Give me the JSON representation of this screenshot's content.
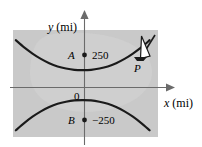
{
  "figure": {
    "background_color": "#ffffff",
    "plot_area_color": "#c9c9c9",
    "plot_area_color_light": "#d4d4d4",
    "curve_color": "#1a1a1a",
    "axis_color": "#6b6b6b",
    "text_color": "#000000"
  },
  "axes": {
    "y_axis_label": "y",
    "y_axis_unit": "(mi)",
    "x_axis_label": "x",
    "x_axis_unit": "(mi)",
    "origin_label": "0"
  },
  "points": [
    {
      "id": "A",
      "name": "A",
      "value_label": "250",
      "marker": "filled-dot",
      "x": 251,
      "y": 250
    },
    {
      "id": "B",
      "name": "B",
      "value_label": "−250",
      "marker": "filled-dot",
      "x": 251,
      "y": -250
    },
    {
      "id": "P",
      "name": "P",
      "value_label": "",
      "marker": "ship",
      "x": 400,
      "y": 150
    }
  ],
  "icons": {
    "ship": "sailboat-icon",
    "dot": "point-marker-icon",
    "x_arrow": "arrow-right-icon",
    "y_arrow": "arrow-up-icon"
  },
  "chart_data": {
    "type": "line",
    "title": "",
    "xlabel": "x (mi)",
    "ylabel": "y (mi)",
    "grid": false,
    "legend": null,
    "xlim": [
      -260,
      260
    ],
    "ylim": [
      -200,
      200
    ],
    "annotations": [
      {
        "text": "A",
        "x": -18,
        "y": 92,
        "style": "italic"
      },
      {
        "text": "250",
        "x": 15,
        "y": 92,
        "style": "normal"
      },
      {
        "text": "B",
        "x": -18,
        "y": -92,
        "style": "italic"
      },
      {
        "text": "−250",
        "x": 15,
        "y": -92,
        "style": "normal"
      },
      {
        "text": "P",
        "x": 118,
        "y": 30,
        "style": "italic"
      },
      {
        "text": "0",
        "x": -14,
        "y": -22,
        "style": "normal"
      }
    ],
    "series": [
      {
        "name": "upper-hyperbola-branch",
        "color": "#1a1a1a",
        "points": [
          [
            -250,
            162
          ],
          [
            -220,
            135
          ],
          [
            -190,
            112
          ],
          [
            -160,
            92
          ],
          [
            -130,
            76
          ],
          [
            -100,
            64
          ],
          [
            -70,
            56
          ],
          [
            -40,
            51
          ],
          [
            -10,
            50
          ],
          [
            20,
            51
          ],
          [
            50,
            56
          ],
          [
            80,
            64
          ],
          [
            110,
            76
          ],
          [
            140,
            92
          ],
          [
            170,
            112
          ],
          [
            200,
            135
          ],
          [
            230,
            162
          ]
        ]
      },
      {
        "name": "lower-hyperbola-branch",
        "color": "#1a1a1a",
        "points": [
          [
            -250,
            -175
          ],
          [
            -220,
            -148
          ],
          [
            -190,
            -124
          ],
          [
            -160,
            -104
          ],
          [
            -130,
            -88
          ],
          [
            -100,
            -76
          ],
          [
            -70,
            -68
          ],
          [
            -40,
            -63
          ],
          [
            -10,
            -62
          ],
          [
            20,
            -63
          ],
          [
            50,
            -68
          ],
          [
            80,
            -76
          ],
          [
            110,
            -88
          ],
          [
            140,
            -104
          ],
          [
            170,
            -124
          ],
          [
            200,
            -148
          ],
          [
            230,
            -175
          ]
        ]
      }
    ]
  }
}
